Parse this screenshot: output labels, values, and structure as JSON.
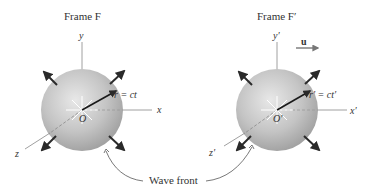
{
  "diagram": {
    "frames": [
      {
        "title": "Frame F",
        "axes": {
          "x": "x",
          "y": "y",
          "z": "z"
        },
        "origin": "O",
        "radius_label": "r = ct",
        "center": [
          82,
          110
        ],
        "radius": 41
      },
      {
        "title": "Frame F′",
        "axes": {
          "x": "x′",
          "y": "y′",
          "z": "z′"
        },
        "origin": "O′",
        "radius_label": "r′ = ct′",
        "center": [
          277,
          110
        ],
        "radius": 41,
        "velocity_label": "u"
      }
    ],
    "shared_label": "Wave front",
    "colors": {
      "sphere_light": "#e6e6e6",
      "sphere_dark": "#9a9a9a",
      "arrow": "#2a2a2a",
      "axis": "#777777",
      "velocity": "#777777"
    }
  }
}
